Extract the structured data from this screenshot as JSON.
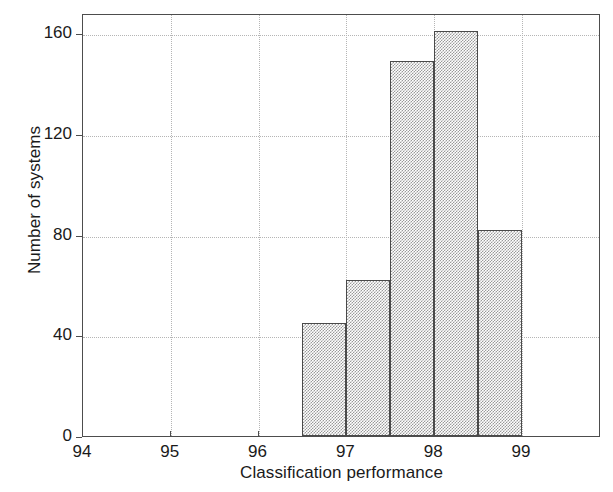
{
  "chart_data": {
    "type": "bar",
    "title": "",
    "subtitle": "",
    "xlabel": "Classification performance",
    "ylabel": "Number of systems",
    "xlim": [
      94,
      99.9
    ],
    "ylim": [
      0,
      168
    ],
    "xticks": [
      94,
      95,
      96,
      97,
      98,
      99
    ],
    "xtick_labels": [
      "94",
      "95",
      "96",
      "97",
      "98",
      "99"
    ],
    "yticks": [
      0,
      40,
      80,
      120,
      160
    ],
    "ytick_labels": [
      "0",
      "40",
      "80",
      "120",
      "160"
    ],
    "grid": true,
    "grid_style": "dotted",
    "legend": null,
    "bin_width": 0.5,
    "bin_edges": [
      96.5,
      97.0,
      97.5,
      98.0,
      98.5,
      99.0
    ],
    "categories": [
      "96.5-97.0",
      "97.0-97.5",
      "97.5-98.0",
      "98.0-98.5",
      "98.5-99.0"
    ],
    "values": [
      45,
      62,
      149,
      161,
      82
    ],
    "bars": [
      {
        "label": "96.5-97.0",
        "x0": 96.5,
        "x1": 97.0,
        "value": 45
      },
      {
        "label": "97.0-97.5",
        "x0": 97.0,
        "x1": 97.5,
        "value": 62
      },
      {
        "label": "97.5-98.0",
        "x0": 97.5,
        "x1": 98.0,
        "value": 149
      },
      {
        "label": "98.0-98.5",
        "x0": 98.0,
        "x1": 98.5,
        "value": 161
      },
      {
        "label": "98.5-99.0",
        "x0": 98.5,
        "x1": 99.0,
        "value": 82
      }
    ],
    "colors": {
      "bar_fill": "#c8c8c8",
      "bar_edge": "#4a4a4a",
      "axis": "#4d4d4d",
      "grid": "#b5b5b5",
      "background": "#ffffff",
      "text": "#1a1a1a"
    }
  }
}
